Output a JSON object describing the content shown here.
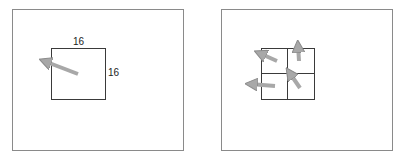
{
  "left_panel": {
    "block_width_label": "16",
    "block_height_label": "16",
    "description": "single block with one motion vector"
  },
  "right_panel": {
    "description": "block split into 4 sub-blocks each with its own motion vector"
  },
  "colors": {
    "frame_border": "#8a8a8a",
    "block_border": "#3a3a3a",
    "arrow_fill": "#a8a8a8",
    "arrow_stroke": "#8c8c8c"
  }
}
